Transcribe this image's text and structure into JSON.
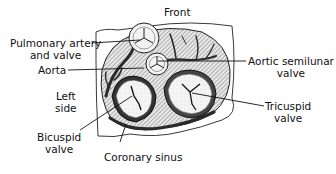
{
  "labels": {
    "front": "Front",
    "pulmonary": [
      "Pulmonary artery",
      "and valve"
    ],
    "aorta": "Aorta",
    "aortic_semilunar": [
      "Aortic semilunar",
      "valve"
    ],
    "left_side": [
      "Left",
      "side"
    ],
    "tricuspid": [
      "Tricuspid",
      "valve"
    ],
    "bicuspid": [
      "Bicuspid",
      "valve"
    ],
    "coronary_sinus": "Coronary sinus"
  },
  "colors": {
    "ink": "#111111",
    "tissue_hatch": "#555555",
    "dark_vessel": "#2a2a2a",
    "valve_fill": "#f2f2f2",
    "background": "#ffffff"
  }
}
